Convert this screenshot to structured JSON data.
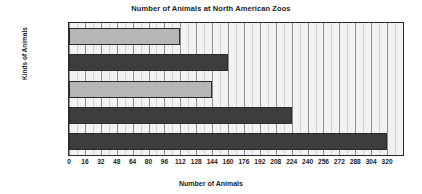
{
  "chart_data": {
    "type": "bar",
    "orientation": "horizontal",
    "title": "Number of Animals at North American Zoos",
    "xlabel": "Number of Animals",
    "ylabel": "Kinds of Animals",
    "categories": [
      "Giraffes",
      "Elephants",
      "Cheetahs",
      "Flamingos",
      "Lions"
    ],
    "values": [
      112,
      160,
      144,
      224,
      320
    ],
    "xlim": [
      0,
      336
    ],
    "xticks": [
      0,
      16,
      32,
      48,
      64,
      80,
      96,
      112,
      128,
      144,
      160,
      176,
      192,
      208,
      224,
      240,
      256,
      272,
      288,
      304,
      320
    ],
    "minor_ticks_per_interval": 2,
    "grid": true,
    "legend": null,
    "bar_colors": [
      "#b6b6b6",
      "#3d3d3d",
      "#b6b6b6",
      "#3d3d3d",
      "#3d3d3d"
    ],
    "bar_edge_color": "#2b2b2b",
    "plot_background": "#f2f2f2",
    "major_gridline_color": "#8e8e8e",
    "minor_gridline_color": "#d2d2d2"
  }
}
